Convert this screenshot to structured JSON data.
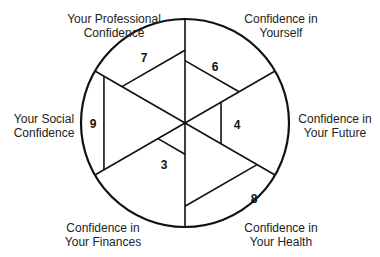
{
  "diagram": {
    "type": "wheel-of-confidence",
    "center": [
      185,
      123
    ],
    "radius": 104,
    "max_score": 10,
    "line_color": "#111111",
    "segments": [
      {
        "key": "yourself",
        "label_lines": [
          "Confidence in",
          "Yourself"
        ],
        "score": 6,
        "start_angle": 30,
        "end_angle": 90
      },
      {
        "key": "future",
        "label_lines": [
          "Confidence in",
          "Your Future"
        ],
        "score": 4,
        "start_angle": -30,
        "end_angle": 30
      },
      {
        "key": "health",
        "label_lines": [
          "Confidence in",
          "Your Health"
        ],
        "score": 8,
        "start_angle": -90,
        "end_angle": -30
      },
      {
        "key": "finances",
        "label_lines": [
          "Confidence in",
          "Your Finances"
        ],
        "score": 3,
        "start_angle": -150,
        "end_angle": -90
      },
      {
        "key": "social",
        "label_lines": [
          "Your Social",
          "Confidence"
        ],
        "score": 9,
        "start_angle": 150,
        "end_angle": 210
      },
      {
        "key": "professional",
        "label_lines": [
          "Your Professional",
          "Confidence"
        ],
        "score": 7,
        "start_angle": 90,
        "end_angle": 150
      }
    ]
  },
  "labels": {
    "professional": {
      "line1": "Your Professional",
      "line2": "Confidence"
    },
    "yourself": {
      "line1": "Confidence in",
      "line2": "Yourself"
    },
    "social": {
      "line1": "Your Social",
      "line2": "Confidence"
    },
    "future": {
      "line1": "Confidence in",
      "line2": "Your Future"
    },
    "finances": {
      "line1": "Confidence in",
      "line2": "Your Finances"
    },
    "health": {
      "line1": "Confidence in",
      "line2": "Your Health"
    }
  },
  "scores": {
    "professional": "7",
    "yourself": "6",
    "social": "9",
    "future": "4",
    "finances": "3",
    "health": "8"
  }
}
